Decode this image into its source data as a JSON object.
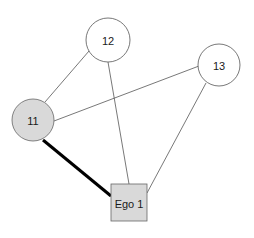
{
  "diagram": {
    "type": "ego-network",
    "nodes": [
      {
        "id": "12",
        "label": "12",
        "shape": "circle",
        "cx": 108,
        "cy": 40,
        "r": 22,
        "fill": "#ffffff",
        "stroke": "#555555"
      },
      {
        "id": "13",
        "label": "13",
        "shape": "circle",
        "cx": 219,
        "cy": 65,
        "r": 21,
        "fill": "#ffffff",
        "stroke": "#555555"
      },
      {
        "id": "11",
        "label": "11",
        "shape": "circle",
        "cx": 33,
        "cy": 120,
        "r": 21,
        "fill": "#d9d9d9",
        "stroke": "#666666"
      },
      {
        "id": "ego1",
        "label": "Ego 1",
        "shape": "square",
        "x": 111,
        "y": 184,
        "w": 36,
        "h": 37,
        "fill": "#d9d9d9",
        "stroke": "#666666"
      }
    ],
    "edges": [
      {
        "from": "11",
        "to": "12",
        "x1": 45,
        "y1": 102,
        "x2": 89,
        "y2": 51,
        "width": 0.8,
        "color": "#555555"
      },
      {
        "from": "11",
        "to": "13",
        "x1": 54,
        "y1": 121,
        "x2": 199,
        "y2": 66,
        "width": 0.8,
        "color": "#555555"
      },
      {
        "from": "12",
        "to": "ego1",
        "x1": 108,
        "y1": 62,
        "x2": 129,
        "y2": 184,
        "width": 0.8,
        "color": "#555555"
      },
      {
        "from": "13",
        "to": "ego1",
        "x1": 206,
        "y1": 83,
        "x2": 147,
        "y2": 193,
        "width": 0.8,
        "color": "#555555"
      },
      {
        "from": "11",
        "to": "ego1",
        "x1": 43,
        "y1": 140,
        "x2": 111,
        "y2": 196,
        "width": 3,
        "color": "#000000"
      }
    ]
  }
}
